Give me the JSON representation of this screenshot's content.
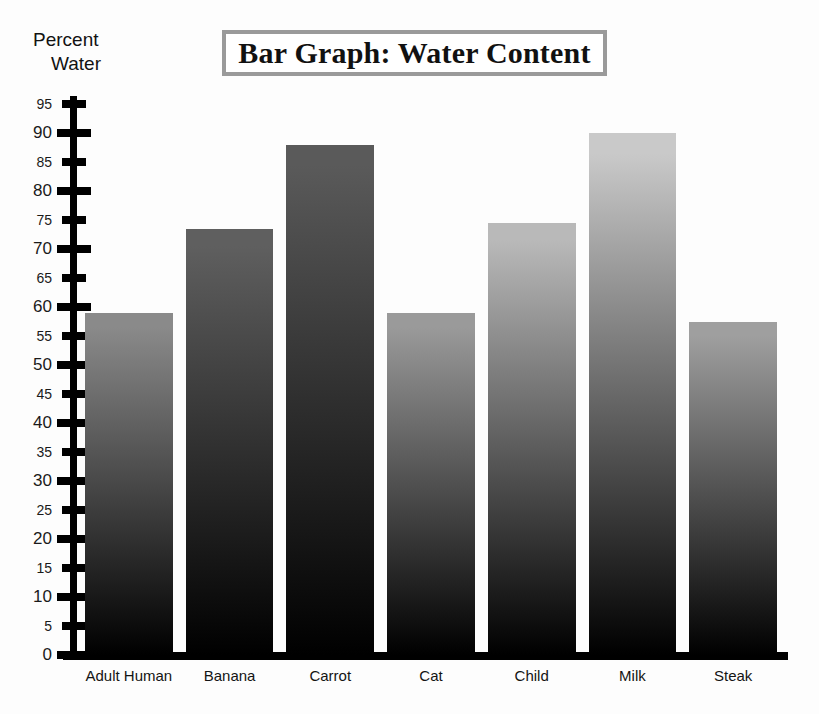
{
  "title": "Bar Graph: Water Content",
  "y_axis_title_line1": "Percent",
  "y_axis_title_line2": "Water",
  "colors": {
    "axis": "#000000",
    "title_border": "#9a9a9a",
    "background": "#fdfdfd",
    "bar_bottom": "#000000"
  },
  "chart_data": {
    "type": "bar",
    "title": "Bar Graph: Water Content",
    "xlabel": "",
    "ylabel": "Percent Water",
    "ylim": [
      0,
      97
    ],
    "grid": false,
    "legend": "none",
    "y_ticks": [
      0,
      5,
      10,
      15,
      20,
      25,
      30,
      35,
      40,
      45,
      50,
      55,
      60,
      65,
      70,
      75,
      80,
      85,
      90,
      95
    ],
    "y_major_ticks": [
      0,
      10,
      20,
      30,
      40,
      50,
      60,
      70,
      80,
      90
    ],
    "categories": [
      "Adult Human",
      "Banana",
      "Carrot",
      "Cat",
      "Child",
      "Milk",
      "Steak"
    ],
    "values": [
      59,
      73.5,
      88,
      59,
      74.5,
      90,
      57.5
    ],
    "bar_top_colors": [
      "#8a8a8a",
      "#5f5f5f",
      "#5a5a5a",
      "#9a9a9a",
      "#b9b9b9",
      "#c9c9c9",
      "#9f9f9f"
    ],
    "bars": [
      {
        "label": "Adult Human",
        "value": 59,
        "top_color": "#8a8a8a"
      },
      {
        "label": "Banana",
        "value": 73.5,
        "top_color": "#5f5f5f"
      },
      {
        "label": "Carrot",
        "value": 88,
        "top_color": "#5a5a5a"
      },
      {
        "label": "Cat",
        "value": 59,
        "top_color": "#9a9a9a"
      },
      {
        "label": "Child",
        "value": 74.5,
        "top_color": "#b9b9b9"
      },
      {
        "label": "Milk",
        "value": 90,
        "top_color": "#c9c9c9"
      },
      {
        "label": "Steak",
        "value": 57.5,
        "top_color": "#9f9f9f"
      }
    ]
  }
}
